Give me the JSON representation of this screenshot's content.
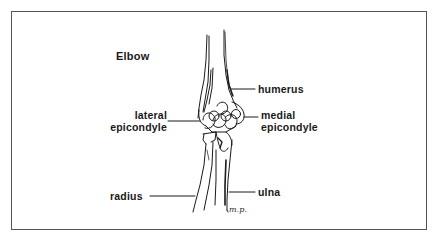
{
  "diagram": {
    "title": "Elbow",
    "labels": {
      "humerus": "humerus",
      "lateral_epicondyle_line1": "lateral",
      "lateral_epicondyle_line2": "epicondyle",
      "medial_epicondyle_line1": "medial",
      "medial_epicondyle_line2": "epicondyle",
      "radius": "radius",
      "ulna": "ulna"
    },
    "signature": "m.p.",
    "colors": {
      "ink": "#1a1a1a",
      "frame": "#555555",
      "background": "#ffffff"
    }
  }
}
